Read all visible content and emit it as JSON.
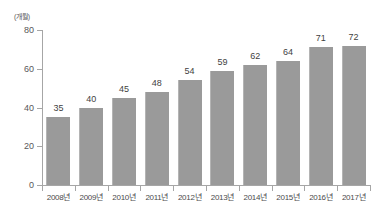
{
  "chart_data": {
    "type": "bar",
    "title": "",
    "xlabel": "",
    "ylabel": "",
    "unit_label": "(개월)",
    "categories": [
      "2008년",
      "2009년",
      "2010년",
      "2011년",
      "2012년",
      "2013년",
      "2014년",
      "2015년",
      "2016년",
      "2017년"
    ],
    "values": [
      35,
      40,
      45,
      48,
      54,
      59,
      62,
      64,
      71,
      72
    ],
    "ylim": [
      0,
      80
    ],
    "yticks": [
      0,
      20,
      40,
      60,
      80
    ],
    "ytick_labels": [
      "0",
      "20",
      "40",
      "60",
      "80"
    ],
    "grid": false,
    "legend": null,
    "colors": {
      "bar": "#9a9a9a",
      "bar_edge": "#b4b4b4",
      "axis": "#a6a6a6",
      "value_text": "#3f3f41",
      "tick_text": "#58585a",
      "category_text": "#4a4a4c",
      "background": "#ffffff"
    }
  }
}
